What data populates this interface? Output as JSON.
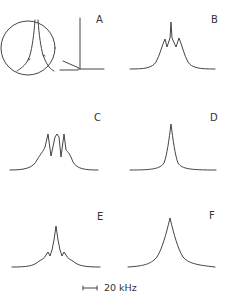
{
  "figure": {
    "panels": [
      {
        "label": "A",
        "description": "narrow spectrum with magnified inset"
      },
      {
        "label": "B",
        "description": "spectrum with central peak and two shoulders"
      },
      {
        "label": "C",
        "description": "triplet spectrum"
      },
      {
        "label": "D",
        "description": "single narrow peak"
      },
      {
        "label": "E",
        "description": "central peak with small side bumps"
      },
      {
        "label": "F",
        "description": "broad single peak"
      }
    ],
    "scale_bar": {
      "label": "20 kHz"
    }
  },
  "colors": {
    "line": "#444444",
    "background": "#ffffff"
  }
}
